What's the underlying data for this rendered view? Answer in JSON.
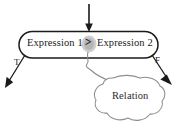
{
  "figure": {
    "decision_node": {
      "left_operand": "Expression 1",
      "operator": ">",
      "right_operand": "Expression 2",
      "shape": "stadium",
      "operator_highlight_color": "#b9b9b9"
    },
    "branches": [
      {
        "label": "T",
        "name": "true-branch",
        "direction": "down-left"
      },
      {
        "label": "F",
        "name": "false-branch",
        "direction": "down-right"
      }
    ],
    "callout": {
      "label": "Relation",
      "shape": "cloud",
      "points_to": "operator"
    },
    "incoming_arrow": {
      "name": "entry-arrow",
      "direction": "down"
    },
    "colors": {
      "stroke": "#1a1a1a",
      "cloud_stroke": "#8d8d8d",
      "text": "#1a1a1a",
      "background": "#ffffff"
    }
  }
}
